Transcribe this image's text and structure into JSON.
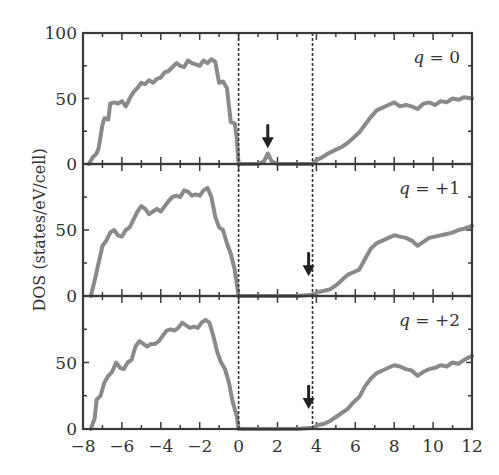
{
  "chart_data": {
    "type": "line",
    "title": "",
    "xlabel": "",
    "ylabel": "DOS (states/eV/cell)",
    "xlim": [
      -8,
      12
    ],
    "x_ticks": [
      -8,
      -6,
      -4,
      -2,
      0,
      2,
      4,
      6,
      8,
      10,
      12
    ],
    "x_tick_labels": [
      "−8",
      "−6",
      "−4",
      "−2",
      "0",
      "2",
      "4",
      "6",
      "8",
      "10",
      "12"
    ],
    "grid": false,
    "legend": "none",
    "line_color": "#8a8a8a",
    "frame_color": "#3a3a3a",
    "reference_lines": [
      {
        "x": 0,
        "style": "dashed",
        "color": "#333333"
      },
      {
        "x": 3.8,
        "style": "dashed",
        "color": "#333333"
      }
    ],
    "panels": [
      {
        "label": "q = 0",
        "label_var": "q",
        "label_value": "= 0",
        "ylim": [
          0,
          100
        ],
        "y_ticks": [
          0,
          50,
          100
        ],
        "y_tick_labels": [
          "0",
          "50",
          "100"
        ],
        "arrow": {
          "x": 1.5,
          "y_tip": 12
        },
        "series": [
          {
            "name": "valence band",
            "x": [
              -7.7,
              -7.5,
              -7.3,
              -7.2,
              -7.0,
              -6.9,
              -6.7,
              -6.6,
              -6.4,
              -6.2,
              -6.0,
              -5.8,
              -5.6,
              -5.4,
              -5.2,
              -5.0,
              -4.8,
              -4.6,
              -4.4,
              -4.2,
              -4.0,
              -3.8,
              -3.6,
              -3.4,
              -3.2,
              -3.0,
              -2.8,
              -2.6,
              -2.4,
              -2.2,
              -2.0,
              -1.8,
              -1.6,
              -1.4,
              -1.2,
              -1.0,
              -0.8,
              -0.6,
              -0.4,
              -0.2,
              -0.1,
              0.0
            ],
            "y": [
              0,
              5,
              8,
              12,
              30,
              35,
              34,
              46,
              47,
              46,
              48,
              44,
              50,
              55,
              58,
              62,
              61,
              64,
              62,
              65,
              66,
              70,
              71,
              74,
              77,
              75,
              74,
              79,
              77,
              76,
              75,
              79,
              77,
              80,
              78,
              62,
              63,
              58,
              32,
              31,
              20,
              0
            ]
          },
          {
            "name": "defect state",
            "x": [
              0.0,
              1.0,
              1.3,
              1.5,
              1.7,
              2.0,
              3.0,
              3.8
            ],
            "y": [
              0,
              0,
              2,
              8,
              2,
              0,
              0,
              0
            ]
          },
          {
            "name": "conduction band",
            "x": [
              3.8,
              4.0,
              4.3,
              4.6,
              5.0,
              5.3,
              5.6,
              5.9,
              6.2,
              6.5,
              6.8,
              7.1,
              7.4,
              7.7,
              8.0,
              8.3,
              8.6,
              8.9,
              9.2,
              9.5,
              9.8,
              10.1,
              10.4,
              10.7,
              11.0,
              11.3,
              11.6,
              12.0
            ],
            "y": [
              0,
              3,
              5,
              8,
              11,
              13,
              16,
              20,
              24,
              30,
              36,
              41,
              43,
              45,
              47,
              44,
              45,
              44,
              42,
              46,
              47,
              45,
              48,
              47,
              50,
              49,
              51,
              50
            ]
          }
        ]
      },
      {
        "label": "q = +1",
        "label_var": "q",
        "label_value": "= +1",
        "ylim": [
          0,
          100
        ],
        "y_ticks": [
          0,
          50
        ],
        "y_tick_labels": [
          "0",
          "50"
        ],
        "arrow": {
          "x": 3.6,
          "y_tip": 15
        },
        "series": [
          {
            "name": "valence band",
            "x": [
              -7.6,
              -7.4,
              -7.2,
              -7.0,
              -6.8,
              -6.6,
              -6.4,
              -6.2,
              -6.0,
              -5.8,
              -5.6,
              -5.4,
              -5.2,
              -5.0,
              -4.8,
              -4.6,
              -4.4,
              -4.2,
              -4.0,
              -3.8,
              -3.6,
              -3.4,
              -3.2,
              -3.0,
              -2.8,
              -2.6,
              -2.4,
              -2.2,
              -2.0,
              -1.8,
              -1.6,
              -1.4,
              -1.2,
              -1.0,
              -0.8,
              -0.6,
              -0.4,
              -0.2,
              0.0
            ],
            "y": [
              0,
              12,
              25,
              38,
              42,
              48,
              50,
              46,
              45,
              50,
              52,
              58,
              64,
              68,
              66,
              62,
              64,
              66,
              64,
              68,
              72,
              75,
              76,
              75,
              80,
              79,
              76,
              77,
              76,
              80,
              82,
              75,
              60,
              52,
              50,
              40,
              32,
              20,
              0
            ]
          },
          {
            "name": "gap",
            "x": [
              0.0,
              3.0,
              3.8
            ],
            "y": [
              0,
              0,
              1
            ]
          },
          {
            "name": "conduction band",
            "x": [
              3.8,
              4.1,
              4.4,
              4.7,
              5.0,
              5.3,
              5.6,
              5.9,
              6.2,
              6.5,
              6.8,
              7.1,
              7.4,
              7.7,
              8.0,
              8.3,
              8.6,
              8.9,
              9.2,
              9.5,
              9.8,
              10.1,
              10.4,
              10.7,
              11.0,
              11.3,
              11.6,
              12.0
            ],
            "y": [
              1,
              3,
              4,
              5,
              8,
              12,
              16,
              18,
              20,
              28,
              36,
              40,
              42,
              44,
              46,
              45,
              44,
              42,
              38,
              41,
              44,
              45,
              46,
              47,
              48,
              50,
              51,
              53
            ]
          }
        ]
      },
      {
        "label": "q = +2",
        "label_var": "q",
        "label_value": "= +2",
        "ylim": [
          0,
          100
        ],
        "y_ticks": [
          0,
          50
        ],
        "y_tick_labels": [
          "0",
          "50"
        ],
        "arrow": {
          "x": 3.6,
          "y_tip": 15
        },
        "series": [
          {
            "name": "valence band",
            "x": [
              -7.6,
              -7.4,
              -7.3,
              -7.1,
              -6.9,
              -6.7,
              -6.5,
              -6.3,
              -6.1,
              -5.9,
              -5.7,
              -5.5,
              -5.3,
              -5.1,
              -4.9,
              -4.7,
              -4.5,
              -4.3,
              -4.1,
              -3.9,
              -3.7,
              -3.5,
              -3.3,
              -3.1,
              -2.9,
              -2.7,
              -2.5,
              -2.3,
              -2.1,
              -1.9,
              -1.7,
              -1.5,
              -1.3,
              -1.1,
              -0.9,
              -0.7,
              -0.5,
              -0.3,
              -0.1,
              0.0
            ],
            "y": [
              0,
              8,
              22,
              25,
              35,
              40,
              43,
              50,
              46,
              45,
              50,
              52,
              62,
              66,
              64,
              62,
              64,
              64,
              66,
              70,
              74,
              75,
              74,
              76,
              80,
              78,
              76,
              77,
              76,
              80,
              82,
              80,
              70,
              58,
              50,
              45,
              35,
              20,
              10,
              0
            ]
          },
          {
            "name": "gap",
            "x": [
              0.0,
              3.0,
              3.8
            ],
            "y": [
              0,
              0,
              1
            ]
          },
          {
            "name": "conduction band",
            "x": [
              3.8,
              4.1,
              4.4,
              4.7,
              5.0,
              5.3,
              5.6,
              5.9,
              6.2,
              6.5,
              6.8,
              7.1,
              7.4,
              7.7,
              8.0,
              8.3,
              8.6,
              8.9,
              9.2,
              9.5,
              9.8,
              10.1,
              10.4,
              10.7,
              11.0,
              11.3,
              11.6,
              12.0
            ],
            "y": [
              1,
              3,
              4,
              6,
              9,
              12,
              15,
              20,
              24,
              32,
              38,
              42,
              44,
              46,
              48,
              47,
              45,
              44,
              40,
              43,
              45,
              46,
              48,
              47,
              50,
              49,
              52,
              55
            ]
          }
        ]
      }
    ]
  }
}
